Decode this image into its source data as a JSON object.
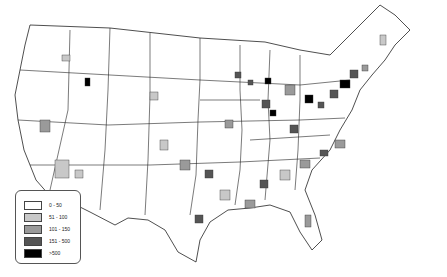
{
  "map": {
    "title": "",
    "region": "Contiguous United States"
  },
  "legend": {
    "items": [
      {
        "label": "0 - 50",
        "color": "#ffffff"
      },
      {
        "label": "51 - 100",
        "color": "#c8c8c8"
      },
      {
        "label": "101 - 150",
        "color": "#9a9a9a"
      },
      {
        "label": "151 - 500",
        "color": "#555555"
      },
      {
        "label": ">500",
        "color": "#000000"
      }
    ]
  }
}
